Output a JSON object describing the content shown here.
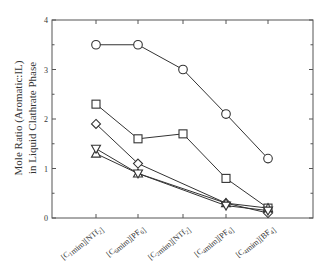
{
  "chart_data": {
    "type": "line",
    "title": "",
    "xlabel": "",
    "ylabel": "Mole Ratio (Aromatic:IL) in Liquid Clathrate Phase",
    "ylabel_line1": "Mole Ratio (Aromatic:IL)",
    "ylabel_line2": "in Liquid Clathrate Phase",
    "categories": [
      "[C1mim][NTf2]",
      "[C6mim][PF6]",
      "[C2mim][NTf2]",
      "[C4mim][PF6]",
      "[C4mim][BF4]"
    ],
    "categories_display": [
      {
        "pre": "[C",
        "sub1": "1",
        "mid": "mim][NTf",
        "sub2": "2",
        "post": "]"
      },
      {
        "pre": "[C",
        "sub1": "6",
        "mid": "mim][PF",
        "sub2": "6",
        "post": "]"
      },
      {
        "pre": "[C",
        "sub1": "2",
        "mid": "mim][NTf",
        "sub2": "2",
        "post": "]"
      },
      {
        "pre": "[C",
        "sub1": "4",
        "mid": "mim][PF",
        "sub2": "6",
        "post": "]"
      },
      {
        "pre": "[C",
        "sub1": "4",
        "mid": "mim][BF",
        "sub2": "4",
        "post": "]"
      }
    ],
    "ylim": [
      0,
      4
    ],
    "yticks": [
      "0",
      "1",
      "2",
      "3",
      "4"
    ],
    "grid": false,
    "legend": null,
    "series": [
      {
        "name": "circle",
        "marker": "circle",
        "values": [
          3.5,
          3.5,
          3.0,
          2.1,
          1.2
        ]
      },
      {
        "name": "square",
        "marker": "square",
        "values": [
          2.3,
          1.6,
          1.7,
          0.8,
          0.2
        ]
      },
      {
        "name": "diamond",
        "marker": "diamond",
        "values": [
          1.9,
          1.1,
          null,
          0.3,
          0.1
        ]
      },
      {
        "name": "triangle-up",
        "marker": "triangle-up",
        "values": [
          1.3,
          0.9,
          null,
          0.3,
          0.2
        ]
      },
      {
        "name": "triangle-down",
        "marker": "triangle-down",
        "values": [
          1.4,
          0.9,
          null,
          0.25,
          0.15
        ]
      }
    ]
  }
}
